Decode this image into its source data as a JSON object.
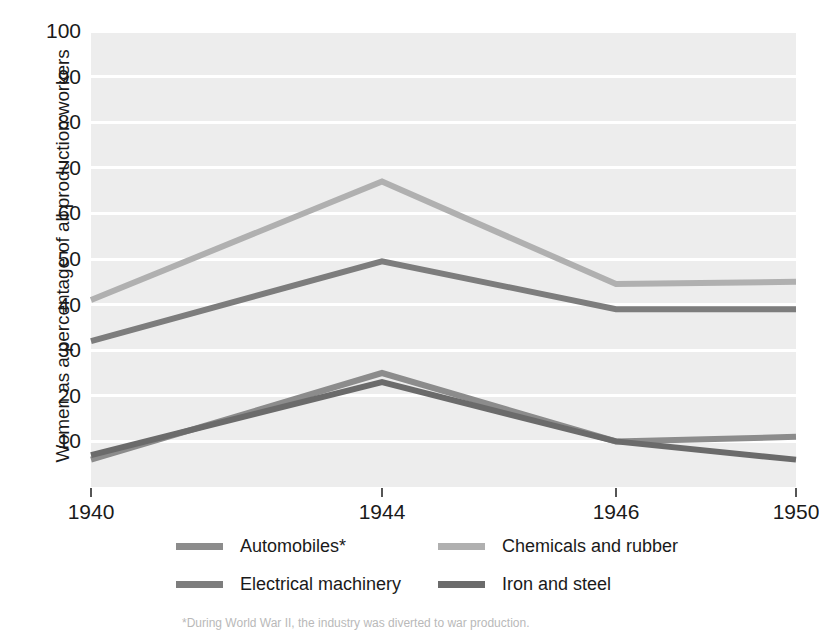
{
  "chart_data": {
    "type": "line",
    "title": "",
    "xlabel": "",
    "ylabel": "Women as a percentage of all production workers",
    "x": [
      1940,
      1944,
      1946,
      1950
    ],
    "xtick_labels": [
      "1940",
      "1944",
      "1946",
      "1950"
    ],
    "ytick_labels": [
      "10",
      "20",
      "30",
      "40",
      "50",
      "60",
      "70",
      "80",
      "90",
      "100"
    ],
    "yticks": [
      10,
      20,
      30,
      40,
      50,
      60,
      70,
      80,
      90,
      100
    ],
    "ylim": [
      0,
      100
    ],
    "xlim": [
      1940,
      1950
    ],
    "grid": true,
    "legend_position": "bottom",
    "series": [
      {
        "name": "Automobiles*",
        "color": "#8c8c8c",
        "values": [
          6,
          25,
          10,
          11
        ]
      },
      {
        "name": "Electrical machinery",
        "color": "#7d7d7d",
        "values": [
          32,
          49.5,
          39,
          39
        ]
      },
      {
        "name": "Chemicals and rubber",
        "color": "#b0b0b0",
        "values": [
          41,
          67,
          44.5,
          45
        ]
      },
      {
        "name": "Iron and steel",
        "color": "#6b6b6b",
        "values": [
          7,
          23,
          10,
          6
        ]
      }
    ]
  },
  "legend": {
    "items": [
      {
        "label": "Automobiles*",
        "color": "#8c8c8c"
      },
      {
        "label": "Chemicals and rubber",
        "color": "#b0b0b0"
      },
      {
        "label": "Electrical machinery",
        "color": "#7d7d7d"
      },
      {
        "label": "Iron and steel",
        "color": "#6b6b6b"
      }
    ]
  },
  "footnote": "*During World War II, the industry was diverted to war production.",
  "style": {
    "plot_background": "#ededed",
    "gridline_color": "#ffffff",
    "text_color": "#1a1a1a"
  }
}
